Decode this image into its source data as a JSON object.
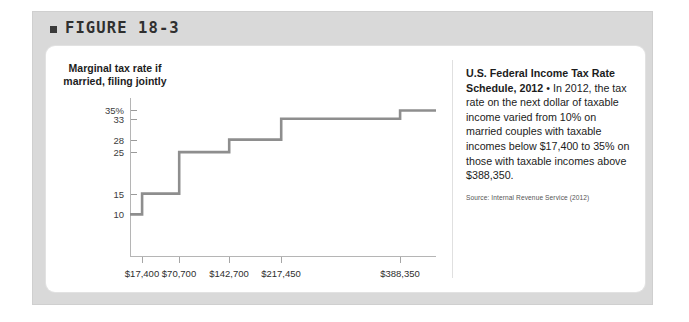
{
  "figure": {
    "bullet_icon": "square-bullet-icon",
    "title": "FIGURE 18-3"
  },
  "chart_data": {
    "type": "line",
    "step": true,
    "title": "",
    "ylabel": "Marginal tax rate if married, filing jointly",
    "xlabel": "",
    "ytick_labels": [
      "35%",
      "33",
      "28",
      "25",
      "15",
      "10"
    ],
    "ytick_values": [
      35,
      33,
      28,
      25,
      15,
      10
    ],
    "ylim": [
      0,
      38
    ],
    "xtick_labels": [
      "$17,400",
      "$70,700",
      "$142,700",
      "$217,450",
      "$388,350"
    ],
    "xtick_values": [
      17400,
      70700,
      142700,
      217450,
      388350
    ],
    "xlim": [
      0,
      440000
    ],
    "grid": false,
    "legend": "none",
    "line_color": "#8e8e8e",
    "brackets": [
      {
        "lower": 0,
        "upper": 17400,
        "rate": 10
      },
      {
        "lower": 17400,
        "upper": 70700,
        "rate": 15
      },
      {
        "lower": 70700,
        "upper": 142700,
        "rate": 25
      },
      {
        "lower": 142700,
        "upper": 217450,
        "rate": 28
      },
      {
        "lower": 217450,
        "upper": 388350,
        "rate": 33
      },
      {
        "lower": 388350,
        "upper": 440000,
        "rate": 35
      }
    ]
  },
  "caption": {
    "title": "U.S. Federal Income Tax Rate Schedule, 2012",
    "body": " • In 2012, the tax rate on the next dollar of taxable income varied from 10% on married couples with taxable incomes below $17,400 to 35% on those with taxable incomes above $388,350.",
    "source": "Source: Internal Revenue Service (2012)"
  }
}
